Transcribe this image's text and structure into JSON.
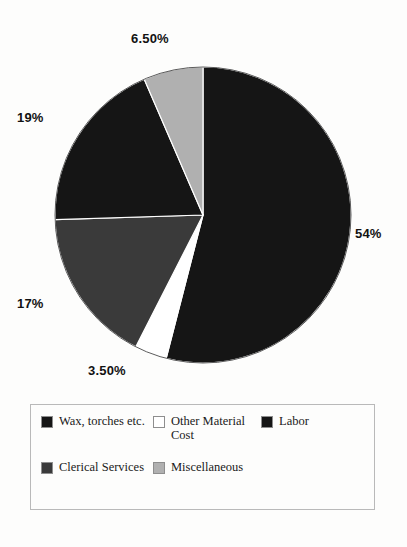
{
  "chart_data": {
    "type": "pie",
    "title": "",
    "start_angle_deg": 0,
    "direction": "clockwise",
    "legend_position": "bottom",
    "grid": false,
    "categories": [
      "Labor",
      "Other Material Cost",
      "Clerical Services",
      "Wax, torches etc.",
      "Miscellaneous"
    ],
    "values": [
      54,
      3.5,
      17,
      19,
      6.5
    ],
    "labels": [
      "54%",
      "3.50%",
      "17%",
      "19%",
      "6.50%"
    ],
    "colors": [
      "#151515",
      "#ffffff",
      "#3a3a3a",
      "#151515",
      "#b0b0b0"
    ],
    "slices": [
      {
        "name": "Labor",
        "value": 54,
        "label": "54%",
        "color": "#151515"
      },
      {
        "name": "Other Material Cost",
        "value": 3.5,
        "label": "3.50%",
        "color": "#ffffff"
      },
      {
        "name": "Clerical Services",
        "value": 17,
        "label": "17%",
        "color": "#3a3a3a"
      },
      {
        "name": "Wax, torches etc.",
        "value": 19,
        "label": "19%",
        "color": "#151515"
      },
      {
        "name": "Miscellaneous",
        "value": 6.5,
        "label": "6.50%",
        "color": "#b0b0b0"
      }
    ]
  },
  "pie": {
    "center_x": 203,
    "center_y": 215,
    "radius": 148,
    "callouts": {
      "top": "6.50%",
      "right": "54%",
      "bottom": "3.50%",
      "left_upper": "19%",
      "left_lower": "17%"
    }
  },
  "legend": {
    "entries": [
      {
        "label": "Wax, torches etc.",
        "color": "#151515"
      },
      {
        "label": "Other Material Cost",
        "color": "#ffffff"
      },
      {
        "label": "Labor",
        "color": "#151515"
      },
      {
        "label": "Clerical Services",
        "color": "#3a3a3a"
      },
      {
        "label": "Miscellaneous",
        "color": "#b0b0b0"
      }
    ]
  }
}
